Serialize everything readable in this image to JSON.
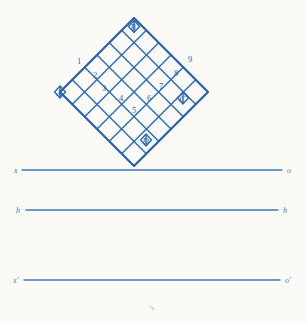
{
  "figure": {
    "accent_color": "#2a66ad",
    "rule_color": "#3d79bb",
    "background_color": "#fbfaf7"
  },
  "lattice": {
    "rows": 6,
    "cols": 6,
    "rotation_degrees": 45,
    "center_x": 134,
    "center_y": 92,
    "half_diagonal": 79,
    "vertex_points": [
      {
        "id": "A",
        "label": "A",
        "position": "left",
        "x": 60,
        "y": 92
      },
      {
        "id": "B",
        "label": "B",
        "position": "top",
        "x": 134,
        "y": 20
      },
      {
        "id": "C",
        "label": "C",
        "position": "right",
        "x": 208,
        "y": 92
      },
      {
        "id": "D",
        "label": "D",
        "position": "bottom-inner",
        "x": 148,
        "y": 142
      }
    ],
    "cell_numbers": [
      {
        "label": "1",
        "x": 79,
        "y": 61
      },
      {
        "label": "2",
        "x": 95,
        "y": 75
      },
      {
        "label": "3",
        "x": 104,
        "y": 88
      },
      {
        "label": "4",
        "x": 121,
        "y": 98
      },
      {
        "label": "5",
        "x": 134,
        "y": 110
      },
      {
        "label": "6",
        "x": 149,
        "y": 98
      },
      {
        "label": "7",
        "x": 161,
        "y": 86
      },
      {
        "label": "8",
        "x": 176,
        "y": 73
      },
      {
        "label": "9",
        "x": 190,
        "y": 59
      }
    ]
  },
  "reference_lines": [
    {
      "id": "line-xo",
      "left_label": "x",
      "right_label": "o",
      "y": 170,
      "x_start": 22,
      "x_end": 282
    },
    {
      "id": "line-hh",
      "left_label": "h",
      "right_label": "h",
      "y": 210,
      "x_start": 26,
      "x_end": 278
    },
    {
      "id": "line-xo-prime",
      "left_label": "x′",
      "right_label": "o′",
      "y": 280,
      "x_start": 24,
      "x_end": 280
    }
  ],
  "footnote": {
    "text": "°s",
    "x": 152,
    "y": 308
  }
}
